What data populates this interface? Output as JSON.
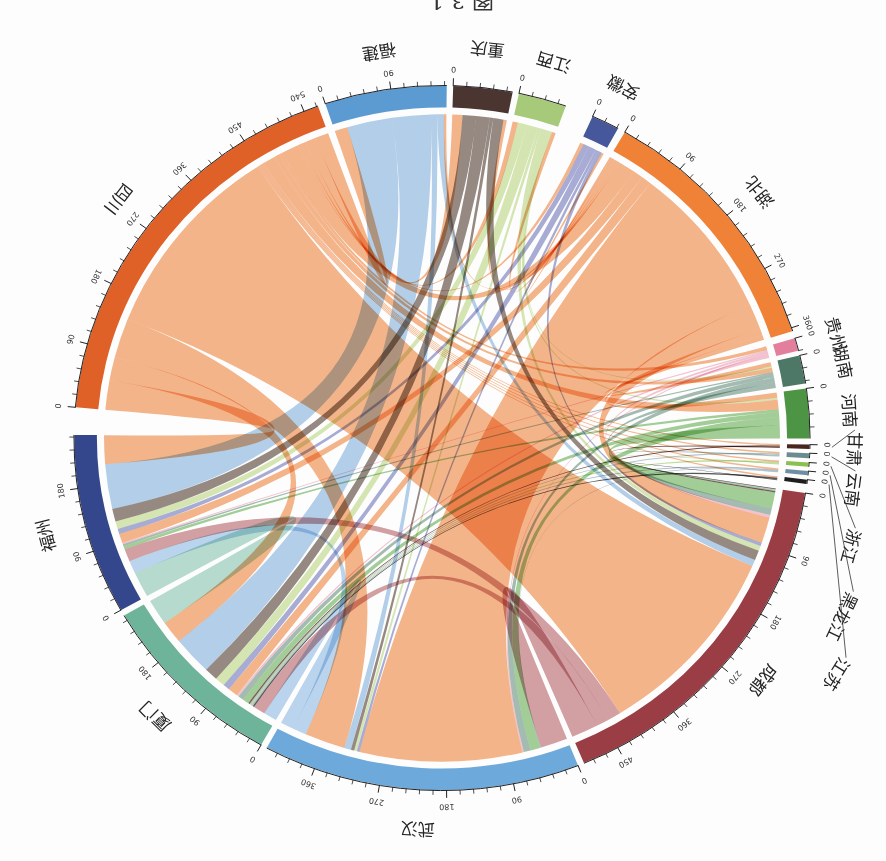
{
  "chart_data": {
    "type": "chord",
    "title": "图 3-1",
    "tick_major": 90,
    "tick_minor": 18,
    "sectors": [
      {
        "name": "四川",
        "value": 560,
        "color": "#DF6128",
        "link_color": "#F6B68A",
        "ticks": [
          0,
          90,
          180,
          270,
          360,
          450,
          540
        ]
      },
      {
        "name": "福建",
        "value": 165,
        "color": "#5C9AD2",
        "link_color": "#B5D0EA",
        "ticks": [
          0,
          90
        ]
      },
      {
        "name": "重庆",
        "value": 80,
        "color": "#4B3530",
        "link_color": "#968A82",
        "ticks": [
          0
        ]
      },
      {
        "name": "江西",
        "value": 65,
        "color": "#A6C97A",
        "link_color": "#D6E7B4",
        "ticks": [
          0
        ]
      },
      {
        "name": "安徽",
        "value": 38,
        "color": "#46579B",
        "link_color": "#A9AED6",
        "ticks": [
          0
        ]
      },
      {
        "name": "湖北",
        "value": 365,
        "color": "#EF8236",
        "link_color": "#F6B68A",
        "ticks": [
          0,
          90,
          180,
          270,
          360
        ]
      },
      {
        "name": "贵州",
        "value": 18,
        "color": "#E37E9C",
        "link_color": "#F4C4D2",
        "ticks": [
          0
        ]
      },
      {
        "name": "湖南",
        "value": 40,
        "color": "#4D7766",
        "link_color": "#A4BDB2",
        "ticks": [
          0
        ]
      },
      {
        "name": "河南",
        "value": 70,
        "color": "#4E9445",
        "link_color": "#A3CF98",
        "ticks": [
          0
        ]
      },
      {
        "name": "甘肃",
        "value": 6,
        "color": "#4A2620",
        "link_color": "#7A5A52",
        "ticks": [
          0
        ]
      },
      {
        "name": "云南",
        "value": 7,
        "color": "#6A8C90",
        "link_color": "#B0C4C6",
        "ticks": [
          0
        ]
      },
      {
        "name": "浙江",
        "value": 6,
        "color": "#8CC04E",
        "link_color": "#C2DE9E",
        "ticks": [
          0
        ]
      },
      {
        "name": "黑龙江",
        "value": 6,
        "color": "#6F8EA2",
        "link_color": "#B0C0CC",
        "ticks": [
          0
        ]
      },
      {
        "name": "江苏",
        "value": 6,
        "color": "#1E1E1E",
        "link_color": "#5A5A5A",
        "ticks": [
          0
        ]
      },
      {
        "name": "成都",
        "value": 500,
        "color": "#9B3D45",
        "link_color": "#D4A0A4",
        "ticks": [
          0,
          90,
          180,
          270,
          360,
          450
        ]
      },
      {
        "name": "武汉",
        "value": 430,
        "color": "#6EA9DB",
        "link_color": "#BBD6EE",
        "ticks": [
          0,
          90,
          180,
          270,
          360
        ]
      },
      {
        "name": "厦门",
        "value": 260,
        "color": "#6DB49A",
        "link_color": "#B8DDD0",
        "ticks": [
          0,
          90,
          180
        ]
      },
      {
        "name": "福州",
        "value": 255,
        "color": "#34478C",
        "link_color": "#8E9AC8",
        "ticks": [
          0,
          90,
          180
        ]
      }
    ],
    "links": [
      [
        "四川",
        "成都",
        300
      ],
      [
        "四川",
        "武汉",
        60
      ],
      [
        "四川",
        "福州",
        45
      ],
      [
        "四川",
        "厦门",
        35
      ],
      [
        "四川",
        "福建",
        20
      ],
      [
        "四川",
        "湖北",
        25
      ],
      [
        "四川",
        "河南",
        18
      ],
      [
        "四川",
        "重庆",
        15
      ],
      [
        "四川",
        "湖南",
        8
      ],
      [
        "四川",
        "江西",
        7
      ],
      [
        "四川",
        "贵州",
        5
      ],
      [
        "四川",
        "安徽",
        5
      ],
      [
        "四川",
        "甘肃",
        2
      ],
      [
        "四川",
        "云南",
        2
      ],
      [
        "四川",
        "浙江",
        2
      ],
      [
        "四川",
        "黑龙江",
        2
      ],
      [
        "四川",
        "江苏",
        2
      ],
      [
        "湖北",
        "武汉",
        240
      ],
      [
        "湖北",
        "成都",
        40
      ],
      [
        "湖北",
        "福州",
        15
      ],
      [
        "湖北",
        "厦门",
        15
      ],
      [
        "湖北",
        "河南",
        10
      ],
      [
        "湖北",
        "湖南",
        8
      ],
      [
        "湖北",
        "重庆",
        5
      ],
      [
        "湖北",
        "江西",
        5
      ],
      [
        "湖北",
        "福建",
        4
      ],
      [
        "湖北",
        "安徽",
        3
      ],
      [
        "福建",
        "福州",
        70
      ],
      [
        "福建",
        "厦门",
        60
      ],
      [
        "福建",
        "成都",
        10
      ],
      [
        "福建",
        "武汉",
        10
      ],
      [
        "重庆",
        "成都",
        15
      ],
      [
        "重庆",
        "武汉",
        5
      ],
      [
        "重庆",
        "厦门",
        20
      ],
      [
        "重庆",
        "福州",
        20
      ],
      [
        "江西",
        "成都",
        8
      ],
      [
        "江西",
        "武汉",
        4
      ],
      [
        "江西",
        "厦门",
        15
      ],
      [
        "江西",
        "福州",
        12
      ],
      [
        "江西",
        "河南",
        4
      ],
      [
        "江西",
        "湖南",
        3
      ],
      [
        "安徽",
        "成都",
        5
      ],
      [
        "安徽",
        "武汉",
        4
      ],
      [
        "安徽",
        "厦门",
        10
      ],
      [
        "安徽",
        "福州",
        8
      ],
      [
        "贵州",
        "成都",
        4
      ],
      [
        "贵州",
        "武汉",
        2
      ],
      [
        "贵州",
        "厦门",
        3
      ],
      [
        "贵州",
        "福州",
        2
      ],
      [
        "湖南",
        "成都",
        10
      ],
      [
        "湖南",
        "武汉",
        10
      ],
      [
        "湖南",
        "厦门",
        8
      ],
      [
        "湖南",
        "福州",
        3
      ],
      [
        "河南",
        "成都",
        25
      ],
      [
        "河南",
        "武汉",
        15
      ],
      [
        "河南",
        "厦门",
        10
      ],
      [
        "河南",
        "福州",
        5
      ],
      [
        "甘肃",
        "成都",
        2
      ],
      [
        "甘肃",
        "厦门",
        2
      ],
      [
        "云南",
        "成都",
        2
      ],
      [
        "云南",
        "厦门",
        2
      ],
      [
        "浙江",
        "成都",
        1
      ],
      [
        "浙江",
        "厦门",
        2
      ],
      [
        "黑龙江",
        "武汉",
        1
      ],
      [
        "黑龙江",
        "厦门",
        2
      ],
      [
        "江苏",
        "成都",
        1
      ],
      [
        "江苏",
        "厦门",
        2
      ],
      [
        "成都",
        "武汉",
        40
      ],
      [
        "成都",
        "福州",
        20
      ],
      [
        "成都",
        "厦门",
        18
      ],
      [
        "武汉",
        "福州",
        20
      ],
      [
        "武汉",
        "厦门",
        20
      ],
      [
        "厦门",
        "福州",
        40
      ]
    ]
  }
}
